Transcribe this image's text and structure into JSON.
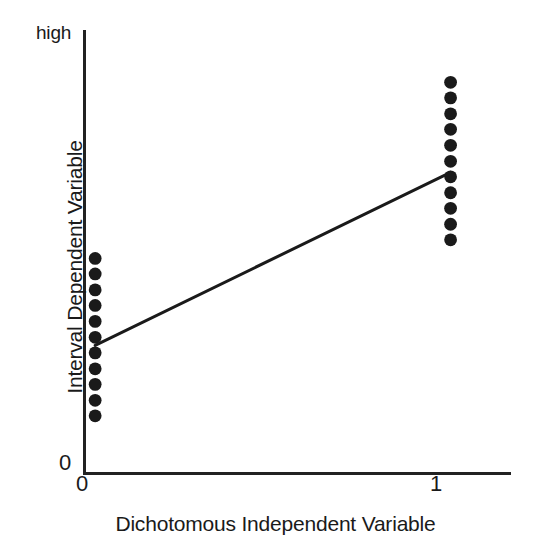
{
  "chart_data": {
    "type": "scatter",
    "title": "",
    "subtitle": "",
    "xlabel": "Dichotomous Independent Variable",
    "ylabel": "Interval Dependent Variable",
    "x_ticks": [
      "0",
      "1"
    ],
    "x_tick_values": [
      0,
      1
    ],
    "y_ticks": [
      "0",
      "high"
    ],
    "y_tick_values": [
      0,
      1
    ],
    "xlim": [
      -0.03,
      1.17
    ],
    "ylim": [
      0,
      1
    ],
    "grid": false,
    "legend": null,
    "marker": "filled-circle",
    "marker_color": "#1a1a1a",
    "line_color": "#1a1a1a",
    "series": [
      {
        "name": "group-0",
        "x": [
          0,
          0,
          0,
          0,
          0,
          0,
          0,
          0,
          0,
          0,
          0
        ],
        "y": [
          0.485,
          0.45,
          0.414,
          0.379,
          0.343,
          0.307,
          0.272,
          0.236,
          0.201,
          0.165,
          0.13
        ]
      },
      {
        "name": "group-1",
        "x": [
          1,
          1,
          1,
          1,
          1,
          1,
          1,
          1,
          1,
          1,
          1
        ],
        "y": [
          0.882,
          0.847,
          0.811,
          0.776,
          0.74,
          0.704,
          0.669,
          0.633,
          0.598,
          0.562,
          0.527
        ]
      }
    ],
    "regression_line": {
      "name": "fit-line",
      "x": [
        0,
        1
      ],
      "y": [
        0.289,
        0.679
      ]
    },
    "annotations": []
  },
  "axis_labels": {
    "y_high": "high",
    "y_zero": "0",
    "x_zero": "0",
    "x_one": "1",
    "y_title": "Interval Dependent Variable",
    "x_title": "Dichotomous Independent Variable"
  },
  "colors": {
    "background": "#ffffff",
    "ink": "#1a1a1a",
    "axis": "#222222"
  }
}
